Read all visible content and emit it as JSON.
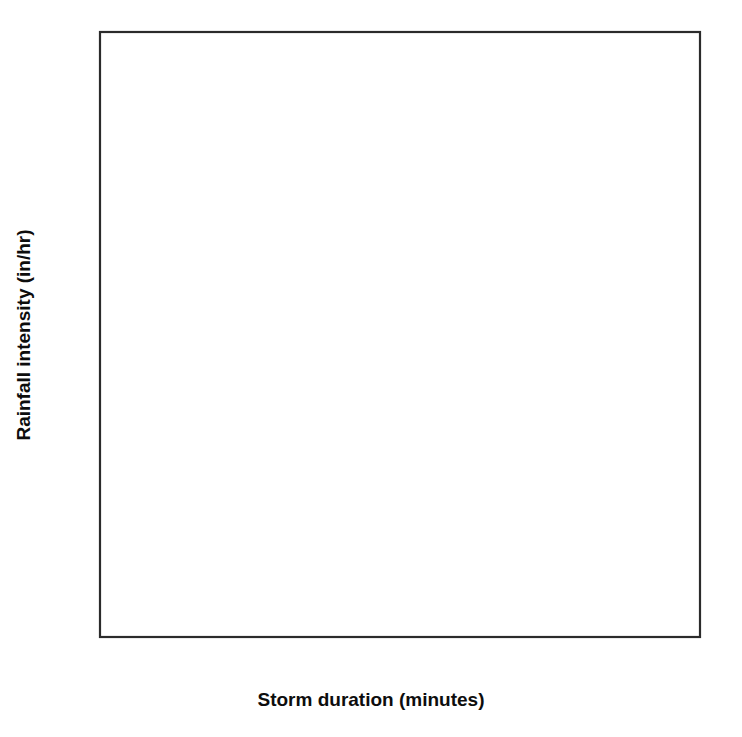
{
  "chart_data": {
    "type": "line",
    "title": "",
    "xlabel": "Storm duration (minutes)",
    "ylabel": "Rainfall intensity (in/hr)",
    "xlim": [
      0,
      90
    ],
    "ylim": [
      0,
      11
    ],
    "xticks": [
      "0",
      "10",
      "20",
      "30",
      "40",
      "50",
      "60",
      "70",
      "80",
      "90"
    ],
    "yticks": [
      "0",
      "1",
      "2",
      "3",
      "4",
      "5",
      "6",
      "7",
      "8",
      "9",
      "10",
      "11"
    ],
    "grid": true,
    "legend_position": "inline-left-labels",
    "x": [
      0,
      5,
      7.5,
      10,
      12.5,
      15,
      20,
      25,
      30,
      35,
      40,
      45,
      50,
      55,
      60,
      70,
      80,
      90
    ],
    "series": [
      {
        "name": "1",
        "emphasis": "bold",
        "label": "1",
        "label_value": 4.0,
        "values": [
          4.0,
          4.0,
          3.7,
          3.3,
          2.95,
          2.65,
          2.2,
          1.9,
          1.68,
          1.5,
          1.36,
          1.25,
          1.16,
          1.08,
          1.0,
          0.9,
          0.82,
          0.75
        ]
      },
      {
        "name": "2t1",
        "emphasis": "thin",
        "label": "",
        "label_value": 4.5,
        "values": [
          4.5,
          4.5,
          4.18,
          3.75,
          3.36,
          3.04,
          2.53,
          2.19,
          1.94,
          1.74,
          1.58,
          1.45,
          1.35,
          1.26,
          1.18,
          1.06,
          0.97,
          0.9
        ]
      },
      {
        "name": "2t2",
        "emphasis": "thin",
        "label": "",
        "label_value": 5.0,
        "values": [
          5.0,
          5.0,
          4.66,
          4.2,
          3.78,
          3.43,
          2.87,
          2.49,
          2.21,
          1.99,
          1.81,
          1.67,
          1.55,
          1.45,
          1.36,
          1.23,
          1.13,
          1.05
        ]
      },
      {
        "name": "2t3",
        "emphasis": "thin",
        "label": "",
        "label_value": 5.5,
        "values": [
          5.5,
          5.5,
          5.14,
          4.65,
          4.2,
          3.82,
          3.21,
          2.8,
          2.49,
          2.25,
          2.05,
          1.89,
          1.76,
          1.65,
          1.55,
          1.4,
          1.29,
          1.2
        ]
      },
      {
        "name": "2t4",
        "emphasis": "thin",
        "label": "",
        "label_value": 5.95,
        "values": [
          5.95,
          5.95,
          5.57,
          5.05,
          4.58,
          4.17,
          3.52,
          3.07,
          2.74,
          2.48,
          2.26,
          2.09,
          1.95,
          1.83,
          1.72,
          1.56,
          1.44,
          1.34
        ]
      },
      {
        "name": "2",
        "emphasis": "bold",
        "label": "2",
        "label_value": 6.4,
        "values": [
          6.4,
          6.4,
          6.0,
          5.45,
          4.95,
          4.52,
          3.83,
          3.35,
          3.0,
          2.72,
          2.48,
          2.3,
          2.15,
          2.02,
          1.9,
          1.73,
          1.6,
          1.49
        ]
      },
      {
        "name": "3t1",
        "emphasis": "thin",
        "label": "",
        "label_value": 6.85,
        "values": [
          6.85,
          6.85,
          6.43,
          5.85,
          5.32,
          4.87,
          4.14,
          3.63,
          3.26,
          2.96,
          2.71,
          2.51,
          2.35,
          2.21,
          2.08,
          1.9,
          1.76,
          1.64
        ]
      },
      {
        "name": "3t2",
        "emphasis": "thin",
        "label": "",
        "label_value": 7.2,
        "values": [
          7.2,
          7.2,
          6.77,
          6.17,
          5.62,
          5.15,
          4.39,
          3.85,
          3.46,
          3.15,
          2.89,
          2.68,
          2.51,
          2.36,
          2.23,
          2.04,
          1.89,
          1.76
        ]
      },
      {
        "name": "3t3",
        "emphasis": "thin",
        "label": "",
        "label_value": 7.55,
        "values": [
          7.55,
          7.55,
          7.11,
          6.49,
          5.92,
          5.43,
          4.64,
          4.08,
          3.67,
          3.34,
          3.07,
          2.85,
          2.67,
          2.52,
          2.38,
          2.18,
          2.02,
          1.89
        ]
      },
      {
        "name": "3t4",
        "emphasis": "thin",
        "label": "",
        "label_value": 7.95,
        "values": [
          7.95,
          7.95,
          7.5,
          6.86,
          6.27,
          5.76,
          4.93,
          4.34,
          3.91,
          3.57,
          3.28,
          3.05,
          2.86,
          2.7,
          2.55,
          2.34,
          2.17,
          2.03
        ]
      },
      {
        "name": "3",
        "emphasis": "bold",
        "label": "3",
        "label_value": 8.4,
        "values": [
          8.4,
          8.4,
          7.93,
          7.27,
          6.66,
          6.13,
          5.27,
          4.65,
          4.2,
          3.84,
          3.54,
          3.29,
          3.09,
          2.92,
          2.76,
          2.54,
          2.36,
          2.21
        ]
      },
      {
        "name": "4t1",
        "emphasis": "thin",
        "label": "",
        "label_value": 8.9,
        "values": [
          8.9,
          8.9,
          8.41,
          7.73,
          7.09,
          6.54,
          5.64,
          4.99,
          4.51,
          4.13,
          3.81,
          3.55,
          3.34,
          3.15,
          2.99,
          2.75,
          2.56,
          2.4
        ]
      },
      {
        "name": "4t2",
        "emphasis": "thin",
        "label": "",
        "label_value": 9.2,
        "values": [
          9.2,
          9.2,
          8.7,
          8.0,
          7.35,
          6.78,
          5.86,
          5.19,
          4.7,
          4.31,
          3.97,
          3.71,
          3.49,
          3.3,
          3.13,
          2.88,
          2.68,
          2.52
        ]
      },
      {
        "name": "4t3",
        "emphasis": "thin",
        "label": "",
        "label_value": 9.5,
        "values": [
          9.5,
          9.5,
          8.99,
          8.28,
          7.61,
          7.02,
          6.07,
          5.38,
          4.88,
          4.47,
          4.13,
          3.86,
          3.63,
          3.43,
          3.26,
          3.0,
          2.8,
          2.63
        ]
      },
      {
        "name": "4t4",
        "emphasis": "thin",
        "label": "",
        "label_value": 9.8,
        "values": [
          9.8,
          9.8,
          9.28,
          8.55,
          7.87,
          7.26,
          6.29,
          5.57,
          5.06,
          4.64,
          4.29,
          4.01,
          3.77,
          3.57,
          3.39,
          3.13,
          2.92,
          2.74
        ]
      },
      {
        "name": "4",
        "emphasis": "bold",
        "label": "4",
        "label_value": 10.25,
        "values": [
          10.25,
          10.25,
          9.72,
          8.97,
          8.27,
          7.64,
          6.64,
          5.89,
          5.36,
          4.92,
          4.56,
          4.26,
          4.01,
          3.8,
          3.61,
          3.34,
          3.12,
          2.94
        ]
      }
    ],
    "bold_curve_labels": [
      "1",
      "2",
      "3",
      "4"
    ]
  },
  "background_ghost_text": [
    "of equation for different",
    "the duration and",
    "storm of 30 min duration",
    "Fig. 2-8 the intensity",
    "intensity is multiplied by the area",
    "a rainfall event"
  ]
}
